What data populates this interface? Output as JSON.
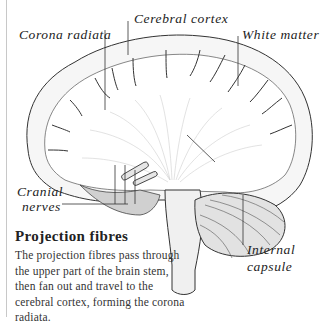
{
  "labels": {
    "corona_radiata": "Corona radiata",
    "cerebral_cortex": "Cerebral cortex",
    "white_matter": "White matter",
    "cranial_nerves_line1": "Cranial",
    "cranial_nerves_line2": "nerves",
    "internal_capsule_line1": "Internal",
    "internal_capsule_line2": "capsule"
  },
  "caption": {
    "title": "Projection fibres",
    "body": "The projection fibres pass through the upper part of the brain stem, then fan out and travel to the cerebral cortex, forming the corona radiata."
  },
  "colors": {
    "ink": "#222222",
    "shade": "#b8b8b8",
    "rule": "#c8c8c8"
  }
}
